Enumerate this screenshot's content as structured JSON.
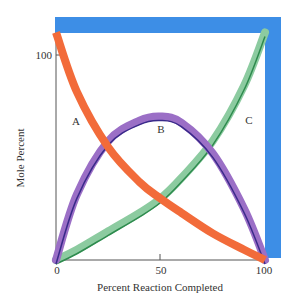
{
  "chart_data": {
    "type": "line",
    "title": "",
    "xlabel": "Percent Reaction Completed",
    "ylabel": "Mole Percent",
    "x_ticks": [
      "0",
      "50",
      "100"
    ],
    "y_ticks": [
      "100"
    ],
    "xlim": [
      0,
      100
    ],
    "ylim": [
      0,
      111
    ],
    "grid": false,
    "legend": "inline curve labels",
    "x": [
      0,
      10,
      25,
      40,
      50,
      60,
      75,
      90,
      100
    ],
    "series": [
      {
        "name": "A",
        "color": "#f26b3a",
        "values": [
          111,
          82,
          55,
          38,
          30,
          23,
          13,
          5,
          0
        ]
      },
      {
        "name": "B",
        "color": "#9b6fc6",
        "values": [
          0,
          32,
          58,
          68,
          70,
          67,
          52,
          25,
          0
        ]
      },
      {
        "name": "C",
        "color": "#8ccba0",
        "values": [
          0,
          5,
          14,
          23,
          30,
          40,
          58,
          85,
          111
        ]
      }
    ],
    "annotations": [
      {
        "text": "A",
        "x": 10,
        "y": 68
      },
      {
        "text": "B",
        "x": 50,
        "y": 64
      },
      {
        "text": "C",
        "x": 92,
        "y": 68
      }
    ],
    "frame_color": "#3d8ee6"
  }
}
